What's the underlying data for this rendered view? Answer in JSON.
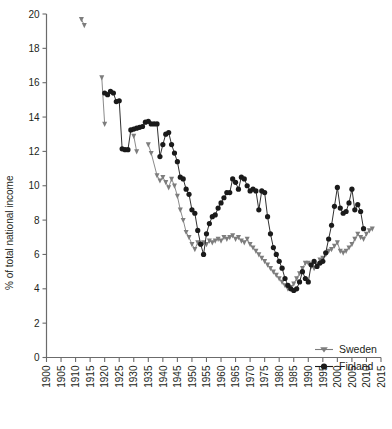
{
  "chart_data": {
    "type": "line",
    "title": "",
    "xlabel": "",
    "ylabel": "% of total national income",
    "xlim": [
      1900,
      2015
    ],
    "ylim": [
      0,
      20
    ],
    "xticks": [
      1900,
      1905,
      1910,
      1915,
      1920,
      1925,
      1930,
      1935,
      1940,
      1945,
      1950,
      1955,
      1960,
      1965,
      1970,
      1975,
      1980,
      1985,
      1990,
      1995,
      2000,
      2005,
      2010,
      2015
    ],
    "yticks": [
      0,
      2,
      4,
      6,
      8,
      10,
      12,
      14,
      16,
      18,
      20
    ],
    "grid": false,
    "legend_position": "bottom-right",
    "series": [
      {
        "name": "Sweden",
        "color": "#7d7d7d",
        "marker": "triangle-down",
        "points": [
          [
            1912,
            19.7
          ],
          [
            1913,
            19.35
          ],
          [
            1919,
            16.3
          ],
          [
            1920,
            13.6
          ],
          [
            1930,
            12.9
          ],
          [
            1931,
            12.0
          ],
          [
            1935,
            12.4
          ],
          [
            1936,
            11.9
          ],
          [
            1938,
            10.6
          ],
          [
            1939,
            10.3
          ],
          [
            1940,
            10.5
          ],
          [
            1941,
            10.2
          ],
          [
            1942,
            9.9
          ],
          [
            1943,
            10.4
          ],
          [
            1944,
            10.0
          ],
          [
            1945,
            9.4
          ],
          [
            1946,
            8.6
          ],
          [
            1947,
            8.0
          ],
          [
            1948,
            7.3
          ],
          [
            1949,
            7.0
          ],
          [
            1950,
            6.6
          ],
          [
            1951,
            6.3
          ],
          [
            1952,
            6.7
          ],
          [
            1953,
            6.6
          ],
          [
            1954,
            6.7
          ],
          [
            1955,
            6.6
          ],
          [
            1956,
            6.8
          ],
          [
            1957,
            6.7
          ],
          [
            1958,
            6.8
          ],
          [
            1959,
            6.9
          ],
          [
            1960,
            6.8
          ],
          [
            1961,
            7.0
          ],
          [
            1962,
            6.9
          ],
          [
            1963,
            7.0
          ],
          [
            1964,
            7.1
          ],
          [
            1965,
            6.9
          ],
          [
            1966,
            7.0
          ],
          [
            1967,
            6.8
          ],
          [
            1968,
            6.7
          ],
          [
            1969,
            6.9
          ],
          [
            1970,
            6.6
          ],
          [
            1971,
            6.4
          ],
          [
            1972,
            6.2
          ],
          [
            1973,
            6.0
          ],
          [
            1974,
            5.8
          ],
          [
            1975,
            5.6
          ],
          [
            1976,
            5.4
          ],
          [
            1977,
            5.2
          ],
          [
            1978,
            5.0
          ],
          [
            1979,
            4.8
          ],
          [
            1980,
            4.6
          ],
          [
            1981,
            4.4
          ],
          [
            1982,
            4.2
          ],
          [
            1983,
            4.0
          ],
          [
            1984,
            4.1
          ],
          [
            1985,
            4.3
          ],
          [
            1986,
            4.6
          ],
          [
            1987,
            4.9
          ],
          [
            1988,
            5.2
          ],
          [
            1989,
            5.5
          ],
          [
            1990,
            5.5
          ],
          [
            1991,
            5.3
          ],
          [
            1992,
            5.2
          ],
          [
            1993,
            5.4
          ],
          [
            1994,
            5.7
          ],
          [
            1995,
            5.8
          ],
          [
            1996,
            6.0
          ],
          [
            1997,
            6.2
          ],
          [
            1998,
            6.3
          ],
          [
            1999,
            6.5
          ],
          [
            2000,
            6.7
          ],
          [
            2001,
            6.2
          ],
          [
            2002,
            6.1
          ],
          [
            2003,
            6.2
          ],
          [
            2004,
            6.4
          ],
          [
            2005,
            6.6
          ],
          [
            2006,
            6.9
          ],
          [
            2007,
            7.2
          ],
          [
            2008,
            7.0
          ],
          [
            2009,
            6.9
          ],
          [
            2010,
            7.2
          ],
          [
            2011,
            7.4
          ],
          [
            2012,
            7.5
          ]
        ]
      },
      {
        "name": "Finland",
        "color": "#1a1a1a",
        "marker": "circle",
        "points": [
          [
            1920,
            15.4
          ],
          [
            1921,
            15.3
          ],
          [
            1922,
            15.5
          ],
          [
            1923,
            15.4
          ],
          [
            1924,
            14.9
          ],
          [
            1925,
            14.95
          ],
          [
            1926,
            12.15
          ],
          [
            1927,
            12.1
          ],
          [
            1928,
            12.1
          ],
          [
            1929,
            13.25
          ],
          [
            1930,
            13.3
          ],
          [
            1931,
            13.35
          ],
          [
            1932,
            13.4
          ],
          [
            1933,
            13.45
          ],
          [
            1934,
            13.7
          ],
          [
            1935,
            13.75
          ],
          [
            1936,
            13.6
          ],
          [
            1937,
            13.6
          ],
          [
            1938,
            13.6
          ],
          [
            1939,
            11.7
          ],
          [
            1940,
            12.4
          ],
          [
            1941,
            13.0
          ],
          [
            1942,
            13.1
          ],
          [
            1943,
            12.4
          ],
          [
            1944,
            11.9
          ],
          [
            1945,
            11.4
          ],
          [
            1946,
            10.5
          ],
          [
            1947,
            10.4
          ],
          [
            1948,
            9.8
          ],
          [
            1949,
            9.5
          ],
          [
            1950,
            8.6
          ],
          [
            1951,
            8.4
          ],
          [
            1952,
            7.4
          ],
          [
            1953,
            6.6
          ],
          [
            1954,
            6.0
          ],
          [
            1955,
            7.2
          ],
          [
            1956,
            7.8
          ],
          [
            1957,
            8.2
          ],
          [
            1958,
            8.3
          ],
          [
            1959,
            8.7
          ],
          [
            1960,
            9.0
          ],
          [
            1961,
            9.3
          ],
          [
            1962,
            9.6
          ],
          [
            1963,
            9.6
          ],
          [
            1964,
            10.4
          ],
          [
            1965,
            10.2
          ],
          [
            1966,
            9.8
          ],
          [
            1967,
            10.5
          ],
          [
            1968,
            10.4
          ],
          [
            1969,
            10.0
          ],
          [
            1970,
            9.7
          ],
          [
            1971,
            9.8
          ],
          [
            1972,
            9.7
          ],
          [
            1973,
            8.6
          ],
          [
            1974,
            9.7
          ],
          [
            1975,
            9.6
          ],
          [
            1976,
            8.2
          ],
          [
            1977,
            7.2
          ],
          [
            1978,
            6.4
          ],
          [
            1979,
            6.0
          ],
          [
            1980,
            5.6
          ],
          [
            1981,
            5.2
          ],
          [
            1982,
            4.6
          ],
          [
            1983,
            4.2
          ],
          [
            1984,
            4.0
          ],
          [
            1985,
            3.9
          ],
          [
            1986,
            4.0
          ],
          [
            1987,
            4.4
          ],
          [
            1988,
            5.0
          ],
          [
            1989,
            4.6
          ],
          [
            1990,
            4.4
          ],
          [
            1991,
            5.4
          ],
          [
            1992,
            5.6
          ],
          [
            1993,
            5.3
          ],
          [
            1994,
            5.5
          ],
          [
            1995,
            5.6
          ],
          [
            1996,
            6.1
          ],
          [
            1997,
            6.9
          ],
          [
            1998,
            7.7
          ],
          [
            1999,
            8.8
          ],
          [
            2000,
            9.9
          ],
          [
            2001,
            8.7
          ],
          [
            2002,
            8.4
          ],
          [
            2003,
            8.5
          ],
          [
            2004,
            9.0
          ],
          [
            2005,
            9.8
          ],
          [
            2006,
            8.6
          ],
          [
            2007,
            8.9
          ],
          [
            2008,
            8.5
          ],
          [
            2009,
            7.5
          ]
        ]
      }
    ]
  },
  "legend": {
    "entries": [
      {
        "label": "Sweden",
        "marker": "triangle-down-marker",
        "color": "#7d7d7d"
      },
      {
        "label": "Finland",
        "marker": "circle-marker",
        "color": "#1a1a1a"
      }
    ]
  },
  "axes": {
    "y_axis_title": "% of total national income"
  }
}
